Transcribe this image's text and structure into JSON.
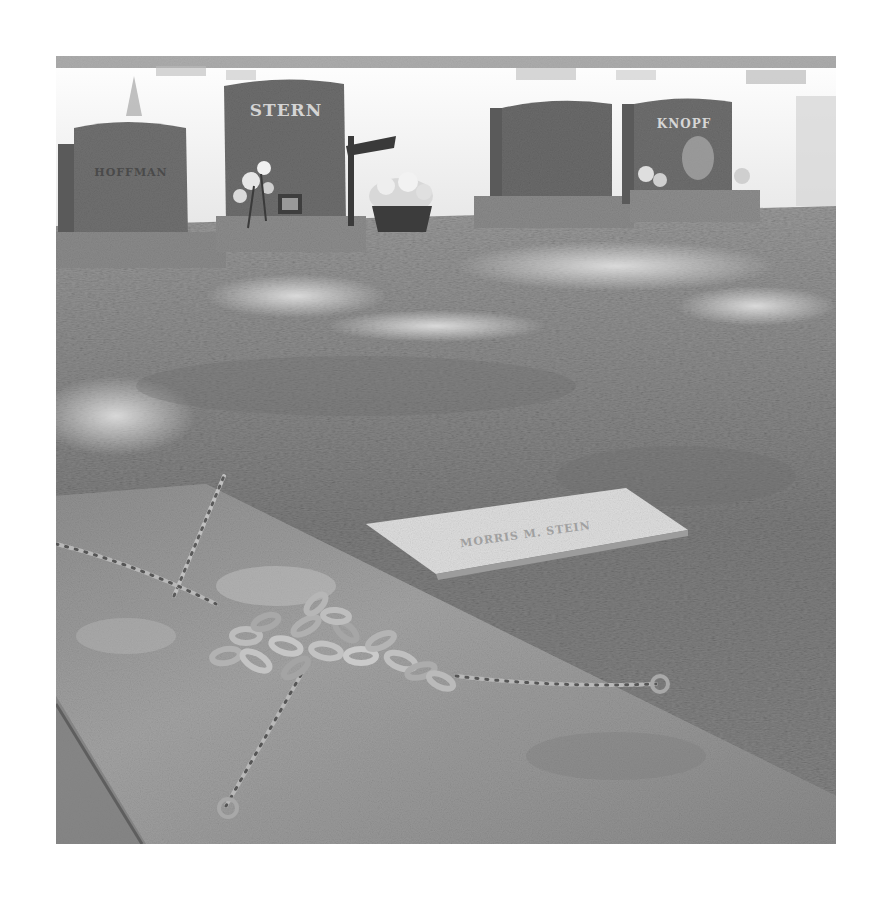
{
  "photo": {
    "subject": "cemetery with chained grave slab",
    "mode": "grayscale",
    "frame": {
      "x": 56,
      "y": 56,
      "width": 780,
      "height": 788
    }
  },
  "headstones": [
    {
      "name": "headstone-left",
      "inscription": "HOFFMAN"
    },
    {
      "name": "headstone-stern",
      "inscription": "STERN"
    },
    {
      "name": "headstone-center-right",
      "inscription": ""
    },
    {
      "name": "headstone-right",
      "inscription": "KNOPF"
    }
  ],
  "flat_marker": {
    "inscription": "MORRIS M. STEIN"
  },
  "colors": {
    "sky": "#f4f4f4",
    "stone_dark": "#6e6e6e",
    "grass": "#8c8c8c",
    "slab": "#9a9a9a",
    "marker": "#dcdcdc",
    "chain": "#b5b5b5"
  }
}
